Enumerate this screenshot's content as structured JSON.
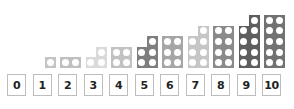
{
  "diagram": {
    "title": "",
    "items": [
      {
        "label": "0",
        "count": 0,
        "color": "#c8c8c8"
      },
      {
        "label": "1",
        "count": 1,
        "color": "#c4c4c4"
      },
      {
        "label": "2",
        "count": 2,
        "color": "#c0c0c0"
      },
      {
        "label": "3",
        "count": 3,
        "color": "#dadada"
      },
      {
        "label": "4",
        "count": 4,
        "color": "#c2c2c2"
      },
      {
        "label": "5",
        "count": 5,
        "color": "#7e7e7e"
      },
      {
        "label": "6",
        "count": 6,
        "color": "#a6a6a6"
      },
      {
        "label": "7",
        "count": 7,
        "color": "#c6c6c6"
      },
      {
        "label": "8",
        "count": 8,
        "color": "#8a8a8a"
      },
      {
        "label": "9",
        "count": 9,
        "color": "#5e5e5e"
      },
      {
        "label": "10",
        "count": 10,
        "color": "#727272"
      }
    ]
  }
}
